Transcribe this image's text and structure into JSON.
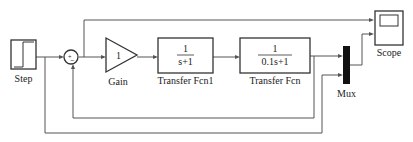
{
  "diagram": {
    "blocks": {
      "step": {
        "label": "Step"
      },
      "sum": {
        "plus": "+",
        "minus": "−"
      },
      "gain": {
        "label": "Gain",
        "value": "1"
      },
      "tf1": {
        "label": "Transfer Fcn1",
        "num": "1",
        "den": "s+1"
      },
      "tf2": {
        "label": "Transfer Fcn",
        "num": "1",
        "den": "0.1s+1"
      },
      "mux": {
        "label": "Mux"
      },
      "scope": {
        "label": "Scope"
      }
    }
  }
}
